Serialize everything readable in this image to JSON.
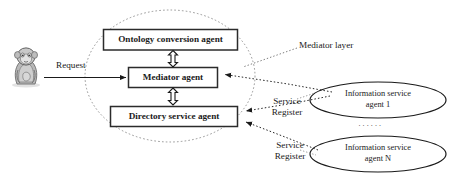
{
  "diagram": {
    "type": "block-diagram",
    "colors": {
      "box_stroke": "#2b2b2b",
      "box_fill": "#ffffff",
      "ellipse_stroke": "#1a1a1a",
      "dotted_stroke": "#7a7a7a",
      "arrow_solid": "#1a1a1a",
      "arrow_dotted": "#6e6e6e",
      "text": "#1a1a1a",
      "background": "#ffffff"
    },
    "boxes": [
      {
        "id": "ontology",
        "label": "Ontology conversion agent"
      },
      {
        "id": "mediator",
        "label": "Mediator agent"
      },
      {
        "id": "directory",
        "label": "Directory service agent"
      }
    ],
    "ellipses": [
      {
        "id": "isa1",
        "line1": "Information service",
        "line2": "agent 1"
      },
      {
        "id": "isaN",
        "line1": "Information service",
        "line2": "agent N"
      }
    ],
    "annotations": {
      "request": "Request",
      "mediator_layer": "Mediator layer",
      "service_register_1_line1": "Service",
      "service_register_1_line2": "Register",
      "service_register_2_line1": "Service",
      "service_register_2_line2": "Register",
      "vertical_ellipsis": "······"
    },
    "icons": {
      "user": "seated-person-icon"
    }
  }
}
